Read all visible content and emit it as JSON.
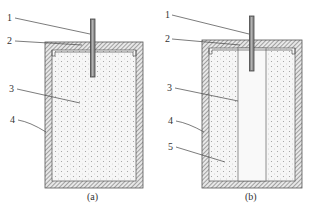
{
  "figure": {
    "panels": [
      {
        "id": "a",
        "caption": "(a)",
        "callouts": [
          {
            "label": "1",
            "target": "rod"
          },
          {
            "label": "2",
            "target": "lid"
          },
          {
            "label": "3",
            "target": "filling"
          },
          {
            "label": "4",
            "target": "wall"
          }
        ]
      },
      {
        "id": "b",
        "caption": "(b)",
        "callouts": [
          {
            "label": "1",
            "target": "rod"
          },
          {
            "label": "2",
            "target": "lid"
          },
          {
            "label": "3",
            "target": "central-column"
          },
          {
            "label": "4",
            "target": "wall"
          },
          {
            "label": "5",
            "target": "outer-filling"
          }
        ]
      }
    ]
  },
  "colors": {
    "hatch": "#7a7a7a",
    "outline": "#555555",
    "fill_dots": "#9a9a9a",
    "fill_bg": "#f6f6f6",
    "column_bg": "#fafafa",
    "leader": "#444444"
  }
}
